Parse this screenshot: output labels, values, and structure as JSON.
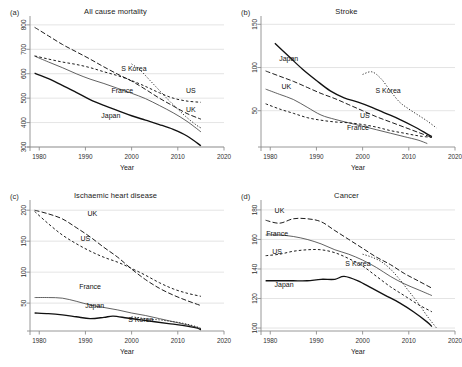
{
  "figure": {
    "width": 462,
    "height": 367,
    "background": "#ffffff",
    "line_color": "#111111",
    "grid_color": "#d9d9d9",
    "axis_color": "#8d8d8d"
  },
  "shared": {
    "xlabel": "Year",
    "xticks": [
      1980,
      1990,
      2000,
      2010,
      2020
    ],
    "xlim": [
      1978,
      2020
    ],
    "series_names": [
      "Japan",
      "France",
      "UK",
      "US",
      "S Korea"
    ]
  },
  "chart_data": [
    {
      "type": "line",
      "panel": "(a)",
      "title": "All cause mortality",
      "xlabel": "Year",
      "ylabel": "",
      "xlim": [
        1978,
        2020
      ],
      "ylim": [
        300,
        820
      ],
      "xticks": [
        1980,
        1990,
        2000,
        2010,
        2020
      ],
      "yticks": [
        300,
        400,
        500,
        600,
        700,
        800
      ],
      "grid": true,
      "legend_position": "inline-labels",
      "annotations": [
        {
          "text": "S Korea",
          "x": 2000.5,
          "y": 612
        },
        {
          "text": "US",
          "x": 2012.8,
          "y": 520
        },
        {
          "text": "UK",
          "x": 2012.8,
          "y": 444
        },
        {
          "text": "France",
          "x": 1998.0,
          "y": 520
        },
        {
          "text": "Japan",
          "x": 1995.5,
          "y": 420
        }
      ],
      "series": [
        {
          "name": "Japan",
          "style": "solid",
          "x": [
            1979,
            1982,
            1985,
            1988,
            1991,
            1994,
            1997,
            2000,
            2003,
            2006,
            2009,
            2012,
            2015
          ],
          "values": [
            602,
            580,
            552,
            524,
            494,
            470,
            449,
            428,
            410,
            392,
            372,
            345,
            305
          ]
        },
        {
          "name": "France",
          "style": "dotted-fine",
          "x": [
            1979,
            1982,
            1985,
            1988,
            1991,
            1994,
            1997,
            2000,
            2003,
            2006,
            2009,
            2012,
            2015
          ],
          "values": [
            672,
            648,
            625,
            600,
            578,
            560,
            540,
            520,
            498,
            470,
            440,
            405,
            362
          ]
        },
        {
          "name": "UK",
          "style": "dashed-long",
          "x": [
            1979,
            1982,
            1985,
            1988,
            1991,
            1994,
            1997,
            2000,
            2003,
            2006,
            2009,
            2012,
            2015
          ],
          "values": [
            790,
            755,
            720,
            690,
            660,
            628,
            598,
            570,
            536,
            500,
            468,
            437,
            414
          ]
        },
        {
          "name": "US",
          "style": "dashed-short",
          "x": [
            1979,
            1982,
            1985,
            1988,
            1991,
            1994,
            1997,
            2000,
            2003,
            2006,
            2009,
            2012,
            2015
          ],
          "values": [
            673,
            660,
            648,
            638,
            625,
            608,
            592,
            572,
            548,
            522,
            500,
            488,
            483
          ]
        },
        {
          "name": "S Korea",
          "style": "dotted",
          "x": [
            2000,
            2002,
            2004,
            2006,
            2008,
            2010,
            2012,
            2014,
            2015
          ],
          "values": [
            640,
            612,
            572,
            532,
            492,
            455,
            420,
            390,
            378
          ]
        }
      ]
    },
    {
      "type": "line",
      "panel": "(b)",
      "title": "Stroke",
      "xlabel": "Year",
      "ylabel": "",
      "xlim": [
        1978,
        2020
      ],
      "ylim": [
        8,
        155
      ],
      "xticks": [
        1980,
        1990,
        2000,
        2010,
        2020
      ],
      "yticks": [
        50,
        100,
        150
      ],
      "grid": true,
      "legend_position": "inline-labels",
      "annotations": [
        {
          "text": "Japan",
          "x": 1984.0,
          "y": 108
        },
        {
          "text": "UK",
          "x": 1983.5,
          "y": 75
        },
        {
          "text": "S Korea",
          "x": 2005.5,
          "y": 70
        },
        {
          "text": "US",
          "x": 2000.5,
          "y": 42
        },
        {
          "text": "France",
          "x": 1999.0,
          "y": 28
        }
      ],
      "series": [
        {
          "name": "Japan",
          "style": "solid",
          "x": [
            1981,
            1984,
            1987,
            1990,
            1993,
            1996,
            1999,
            2002,
            2005,
            2008,
            2011,
            2014,
            2015
          ],
          "values": [
            128,
            113,
            98,
            85,
            73,
            65,
            60,
            54,
            47,
            40,
            32,
            23,
            20
          ]
        },
        {
          "name": "France",
          "style": "dotted-fine",
          "x": [
            1979,
            1982,
            1985,
            1988,
            1991,
            1994,
            1997,
            2000,
            2003,
            2006,
            2009,
            2012,
            2014
          ],
          "values": [
            75,
            69,
            63,
            54,
            45,
            40,
            36,
            32,
            28,
            24,
            20,
            16,
            12
          ]
        },
        {
          "name": "UK",
          "style": "dashed-long",
          "x": [
            1979,
            1982,
            1985,
            1988,
            1991,
            1994,
            1997,
            2000,
            2003,
            2006,
            2009,
            2012,
            2015
          ],
          "values": [
            96,
            90,
            84,
            77,
            70,
            64,
            57,
            50,
            43,
            37,
            31,
            25,
            19
          ]
        },
        {
          "name": "US",
          "style": "dashed-short",
          "x": [
            1979,
            1982,
            1985,
            1988,
            1991,
            1994,
            1997,
            2000,
            2003,
            2006,
            2009,
            2012,
            2015
          ],
          "values": [
            58,
            52,
            47,
            42,
            39,
            37,
            36,
            34,
            31,
            27,
            24,
            21,
            19
          ]
        },
        {
          "name": "S Korea",
          "style": "dotted",
          "x": [
            2000,
            2002,
            2004,
            2006,
            2008,
            2010,
            2012,
            2014,
            2016
          ],
          "values": [
            92,
            95,
            87,
            73,
            60,
            52,
            45,
            38,
            30
          ]
        }
      ]
    },
    {
      "type": "line",
      "panel": "(c)",
      "title": "Ischaemic heart disease",
      "xlabel": "Year",
      "ylabel": "",
      "xlim": [
        1978,
        2020
      ],
      "ylim": [
        5,
        210
      ],
      "xticks": [
        1980,
        1990,
        2000,
        2010,
        2020
      ],
      "yticks": [
        50,
        100,
        150,
        200
      ],
      "grid": true,
      "legend_position": "inline-labels",
      "annotations": [
        {
          "text": "UK",
          "x": 1991.5,
          "y": 190
        },
        {
          "text": "US",
          "x": 1990.0,
          "y": 150
        },
        {
          "text": "France",
          "x": 1991.0,
          "y": 72
        },
        {
          "text": "Japan",
          "x": 1992.0,
          "y": 42
        },
        {
          "text": "S Korea",
          "x": 2002.0,
          "y": 20
        }
      ],
      "series": [
        {
          "name": "Japan",
          "style": "solid",
          "x": [
            1979,
            1982,
            1985,
            1988,
            1991,
            1994,
            1996,
            1999,
            2002,
            2005,
            2008,
            2011,
            2014,
            2015
          ],
          "values": [
            34,
            33,
            31,
            28,
            25,
            27,
            29,
            26,
            23,
            20,
            17,
            14,
            10,
            7
          ]
        },
        {
          "name": "France",
          "style": "dotted-fine",
          "x": [
            1979,
            1982,
            1985,
            1988,
            1991,
            1994,
            1997,
            2000,
            2003,
            2006,
            2009,
            2012,
            2015
          ],
          "values": [
            59,
            59,
            58,
            53,
            47,
            43,
            39,
            34,
            30,
            25,
            20,
            15,
            9
          ]
        },
        {
          "name": "UK",
          "style": "dashed-long",
          "x": [
            1979,
            1982,
            1985,
            1988,
            1991,
            1994,
            1997,
            2000,
            2003,
            2006,
            2009,
            2012,
            2015
          ],
          "values": [
            200,
            194,
            186,
            172,
            157,
            140,
            124,
            105,
            88,
            74,
            63,
            54,
            46
          ]
        },
        {
          "name": "US",
          "style": "dashed-short",
          "x": [
            1979,
            1982,
            1985,
            1988,
            1991,
            1994,
            1997,
            2000,
            2003,
            2006,
            2009,
            2012,
            2015
          ],
          "values": [
            198,
            178,
            160,
            146,
            134,
            124,
            116,
            106,
            95,
            83,
            73,
            66,
            61
          ]
        },
        {
          "name": "S Korea",
          "style": "dotted",
          "x": [
            2000,
            2002,
            2004,
            2006,
            2008,
            2010,
            2012,
            2014,
            2015
          ],
          "values": [
            28,
            26,
            24,
            23,
            21,
            19,
            16,
            12,
            9
          ]
        }
      ]
    },
    {
      "type": "line",
      "panel": "(d)",
      "title": "Cancer",
      "xlabel": "Year",
      "ylabel": "",
      "xlim": [
        1978,
        2020
      ],
      "ylim": [
        98,
        184
      ],
      "xticks": [
        1980,
        1990,
        2000,
        2010,
        2020
      ],
      "yticks": [
        100,
        120,
        140,
        160,
        180
      ],
      "grid": true,
      "legend_position": "inline-labels",
      "annotations": [
        {
          "text": "UK",
          "x": 1982.0,
          "y": 178
        },
        {
          "text": "France",
          "x": 1981.5,
          "y": 162
        },
        {
          "text": "US",
          "x": 1981.5,
          "y": 150
        },
        {
          "text": "S Korea",
          "x": 1999.0,
          "y": 142
        },
        {
          "text": "Japan",
          "x": 1983.0,
          "y": 128
        }
      ],
      "series": [
        {
          "name": "Japan",
          "style": "solid",
          "x": [
            1979,
            1982,
            1985,
            1988,
            1991,
            1994,
            1996,
            1999,
            2002,
            2005,
            2008,
            2011,
            2014,
            2015
          ],
          "values": [
            132,
            132,
            132,
            132,
            133,
            133,
            135,
            132,
            127,
            122,
            117,
            111,
            104,
            101
          ]
        },
        {
          "name": "France",
          "style": "dotted-fine",
          "x": [
            1979,
            1982,
            1985,
            1988,
            1991,
            1994,
            1997,
            2000,
            2003,
            2006,
            2009,
            2012,
            2015
          ],
          "values": [
            163,
            163,
            162,
            160,
            157,
            153,
            150,
            146,
            141,
            135,
            130,
            126,
            122
          ]
        },
        {
          "name": "UK",
          "style": "dashed-long",
          "x": [
            1979,
            1982,
            1985,
            1988,
            1991,
            1994,
            1997,
            2000,
            2003,
            2006,
            2009,
            2012,
            2015
          ],
          "values": [
            173,
            171,
            174,
            174,
            172,
            166,
            160,
            154,
            148,
            143,
            137,
            132,
            127
          ]
        },
        {
          "name": "US",
          "style": "dashed-short",
          "x": [
            1979,
            1982,
            1985,
            1988,
            1991,
            1994,
            1997,
            2000,
            2003,
            2006,
            2009,
            2012,
            2015
          ],
          "values": [
            149,
            150,
            152,
            153,
            153,
            151,
            147,
            142,
            135,
            128,
            122,
            116,
            111
          ]
        },
        {
          "name": "S Korea",
          "style": "dotted",
          "x": [
            2000,
            2002,
            2004,
            2006,
            2008,
            2010,
            2012,
            2014,
            2016
          ],
          "values": [
            150,
            148,
            145,
            140,
            133,
            125,
            117,
            108,
            100
          ]
        }
      ]
    }
  ]
}
